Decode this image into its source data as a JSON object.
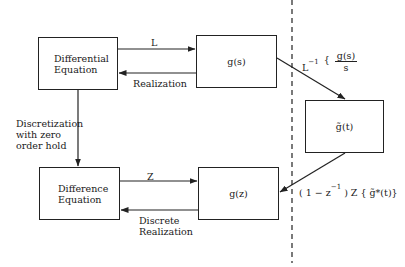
{
  "diagram": {
    "boxes": {
      "differential_equation": [
        "Differential",
        "Equation"
      ],
      "g_s": "g(s)",
      "g_tilde_t": "g̃(t)",
      "difference_equation": [
        "Difference",
        "Equation"
      ],
      "g_z": "g(z)"
    },
    "edges": {
      "laplace": "L",
      "realization": "Realization",
      "discretization": [
        "Discretization",
        "with zero",
        "order hold"
      ],
      "z_transform": "Z",
      "discrete_realization": [
        "Discrete",
        "Realization"
      ],
      "inverse_laplace": {
        "prefix": "L",
        "superscript": "−1",
        "bracket": "{",
        "numerator": "g(s)",
        "denominator": "s"
      },
      "zoh_z_transform": {
        "open": "( 1 − z",
        "superscript": "−1",
        "rest": " )  Z  { g̃*(t)}"
      }
    },
    "separator": "dashed-vertical-line"
  }
}
